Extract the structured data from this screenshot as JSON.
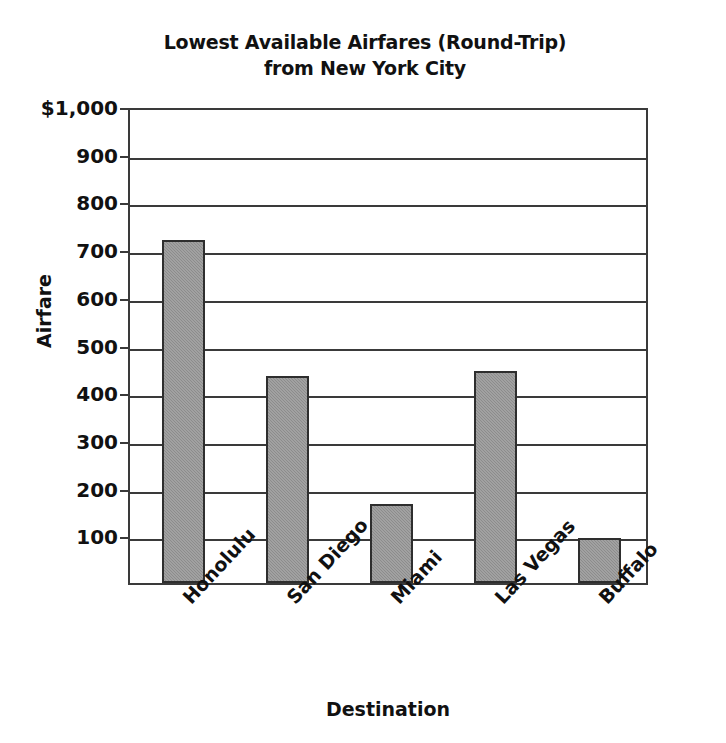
{
  "chart_data": {
    "type": "bar",
    "title": "Lowest Available Airfares (Round-Trip) from New York City",
    "title_lines": [
      "Lowest Available Airfares (Round-Trip)",
      "from New York City"
    ],
    "xlabel": "Destination",
    "ylabel": "Airfare",
    "categories": [
      "Honolulu",
      "San Diego",
      "Miami",
      "Las Vegas",
      "Buffalo"
    ],
    "values": [
      720,
      435,
      165,
      445,
      95
    ],
    "ylim": [
      0,
      1000
    ],
    "ytick_values": [
      1000,
      900,
      800,
      700,
      600,
      500,
      400,
      300,
      200,
      100
    ],
    "ytick_labels": [
      "$1,000",
      "900",
      "800",
      "700",
      "600",
      "500",
      "400",
      "300",
      "200",
      "100"
    ],
    "grid": true,
    "grid_axis": "y",
    "legend": "none",
    "bar_fill_color": "#8c8c8c",
    "bar_edge_color": "#2e2e2e",
    "axis_color": "#3a3a3a",
    "background_color": "#ffffff",
    "series": [
      {
        "name": "Lowest available round-trip airfare",
        "points": [
          {
            "category": "Honolulu",
            "value": 720
          },
          {
            "category": "San Diego",
            "value": 435
          },
          {
            "category": "Miami",
            "value": 165
          },
          {
            "category": "Las Vegas",
            "value": 445
          },
          {
            "category": "Buffalo",
            "value": 95
          }
        ]
      }
    ]
  }
}
